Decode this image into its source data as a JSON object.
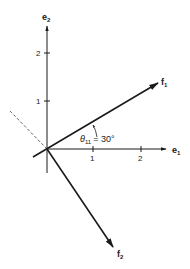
{
  "diagram": {
    "type": "vector-basis-diagram",
    "axes": {
      "e1": {
        "label": "e",
        "subscript": "1",
        "ticks": [
          "1",
          "2"
        ]
      },
      "e2": {
        "label": "e",
        "subscript": "2",
        "ticks": [
          "1",
          "2"
        ]
      }
    },
    "vectors": {
      "f1": {
        "label": "f",
        "subscript": "1"
      },
      "f2": {
        "label": "f",
        "subscript": "2"
      }
    },
    "angle": {
      "symbol": "θ",
      "subscript": "11",
      "equals": "= 30°"
    },
    "colors": {
      "line": "#1a1a1a",
      "dashed": "#555555"
    }
  }
}
